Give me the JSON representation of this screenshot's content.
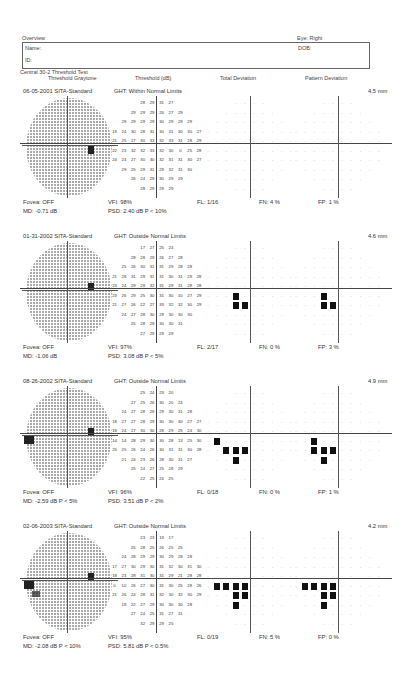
{
  "header": {
    "title": "Overview",
    "eye": "Eye: Right",
    "name_label": "Name:",
    "dob_label": "DOB:",
    "id_label": "ID:",
    "test_name": "Central 30-2 Threshold Test",
    "columns": [
      "Threshold Graytone",
      "Threshold (dB)",
      "Total Deviation",
      "Pattern Deviation"
    ]
  },
  "exams": [
    {
      "date": "06-05-2001",
      "strategy": "SITA-Standard",
      "ght": "GHT: Within Normal Limits",
      "pupil": "4.5 mm",
      "fovea": "Fovea: OFF",
      "md": "MD:  -0.71 dB",
      "vfi": "VFI:  98%",
      "psd": "PSD:  2.40 dB  P < 10%",
      "fl": "FL: 1/16",
      "fn": "FN:  4 %",
      "fp": "FP:  1 %",
      "thresholds": [
        [
          "28",
          "29",
          "31",
          "27"
        ],
        [
          "29",
          "29",
          "29",
          "26",
          "27",
          "29"
        ],
        [
          "28",
          "29",
          "29",
          "29",
          "30",
          "29",
          "29",
          "29"
        ],
        [
          "19",
          "24",
          "30",
          "28",
          "31",
          "30",
          "31",
          "30",
          "30",
          "27"
        ],
        [
          "21",
          "25",
          "27",
          "30",
          "33",
          "32",
          "33",
          "31",
          "28",
          "29"
        ],
        [
          "22",
          "23",
          "32",
          "32",
          "33",
          "32",
          "30",
          "0",
          "25",
          "28"
        ],
        [
          "24",
          "24",
          "27",
          "30",
          "30",
          "32",
          "31",
          "31",
          "30",
          "27"
        ],
        [
          "29",
          "25",
          "29",
          "31",
          "29",
          "32",
          "31",
          "30"
        ],
        [
          "26",
          "24",
          "29",
          "30",
          "29",
          "29"
        ],
        [
          "28",
          "29",
          "29",
          "29"
        ]
      ],
      "total_dev_dark": [],
      "pattern_dev_dark": []
    },
    {
      "date": "01-31-2002",
      "strategy": "SITA-Standard",
      "ght": "GHT: Outside Normal Limits",
      "pupil": "4.6 mm",
      "fovea": "Fovea: OFF",
      "md": "MD:  -1.06 dB",
      "vfi": "VFI:  97%",
      "psd": "PSD:  3.08 dB  P < 5%",
      "fl": "FL: 2/17",
      "fn": "FN:  0 %",
      "fp": "FP:  3 %",
      "thresholds": [
        [
          "17",
          "27",
          "25",
          "24"
        ],
        [
          "28",
          "28",
          "29",
          "26",
          "27",
          "28"
        ],
        [
          "25",
          "26",
          "30",
          "31",
          "31",
          "29",
          "28",
          "28"
        ],
        [
          "21",
          "28",
          "31",
          "29",
          "31",
          "31",
          "30",
          "31",
          "29",
          "28"
        ],
        [
          "23",
          "24",
          "29",
          "29",
          "32",
          "31",
          "29",
          "31",
          "28",
          "28"
        ],
        [
          "23",
          "26",
          "29",
          "25",
          "30",
          "31",
          "30",
          "10",
          "27",
          "29"
        ],
        [
          "21",
          "27",
          "26",
          "22",
          "27",
          "33",
          "32",
          "32",
          "30",
          "29"
        ],
        [
          "24",
          "27",
          "28",
          "30",
          "29",
          "30",
          "30",
          "30"
        ],
        [
          "25",
          "28",
          "29",
          "30",
          "30",
          "31"
        ],
        [
          "27",
          "29",
          "29",
          "29"
        ]
      ],
      "total_dev_dark": [
        [
          5,
          3
        ],
        [
          6,
          3
        ],
        [
          6,
          4
        ]
      ],
      "pattern_dev_dark": [
        [
          5,
          3
        ],
        [
          6,
          3
        ],
        [
          6,
          4
        ]
      ]
    },
    {
      "date": "08-26-2002",
      "strategy": "SITA-Standard",
      "ght": "GHT: Outside Normal Limits",
      "pupil": "4.9 mm",
      "fovea": "Fovea: OFF",
      "md": "MD:  -2.59 dB  P < 5%",
      "vfi": "VFI:  96%",
      "psd": "PSD:  3.51 dB  P < 2%",
      "fl": "FL: 0/18",
      "fn": "FN:  0 %",
      "fp": "FP:  1 %",
      "thresholds": [
        [
          "25",
          "24",
          "23",
          "20"
        ],
        [
          "27",
          "25",
          "26",
          "30",
          "20",
          "24"
        ],
        [
          "24",
          "27",
          "28",
          "29",
          "29",
          "30",
          "31",
          "28"
        ],
        [
          "18",
          "27",
          "27",
          "28",
          "29",
          "30",
          "30",
          "30",
          "27",
          "27"
        ],
        [
          "18",
          "24",
          "27",
          "30",
          "30",
          "28",
          "29",
          "25",
          "24",
          "30"
        ],
        [
          "14",
          "14",
          "28",
          "29",
          "30",
          "30",
          "28",
          "13",
          "25",
          "30"
        ],
        [
          "25",
          "25",
          "26",
          "24",
          "26",
          "30",
          "31",
          "31",
          "30",
          "28"
        ],
        [
          "21",
          "24",
          "23",
          "26",
          "28",
          "30",
          "31",
          "27"
        ],
        [
          "25",
          "24",
          "27",
          "25",
          "28",
          "29"
        ],
        [
          "22",
          "25",
          "24",
          "25"
        ]
      ],
      "total_dev_dark": [
        [
          5,
          1
        ],
        [
          6,
          2
        ],
        [
          6,
          3
        ],
        [
          6,
          4
        ],
        [
          7,
          3
        ]
      ],
      "pattern_dev_dark": [
        [
          5,
          2
        ],
        [
          6,
          2
        ],
        [
          6,
          3
        ],
        [
          6,
          4
        ],
        [
          7,
          3
        ]
      ]
    },
    {
      "date": "02-06-2003",
      "strategy": "SITA-Standard",
      "ght": "GHT: Outside Normal Limits",
      "pupil": "4.2 mm",
      "fovea": "Fovea: OFF",
      "md": "MD:  -2.08 dB  P < 10%",
      "vfi": "VFI:  95%",
      "psd": "PSD:  5.81 dB  P < 0.5%",
      "fl": "FL: 0/19",
      "fn": "FN:  5 %",
      "fp": "FP:  0 %",
      "thresholds": [
        [
          "23",
          "23",
          "19",
          "17"
        ],
        [
          "25",
          "28",
          "25",
          "26",
          "25",
          "25"
        ],
        [
          "24",
          "28",
          "29",
          "29",
          "30",
          "29",
          "28",
          "28"
        ],
        [
          "17",
          "27",
          "30",
          "29",
          "30",
          "31",
          "32",
          "30",
          "31",
          "30"
        ],
        [
          "18",
          "23",
          "28",
          "31",
          "30",
          "31",
          "29",
          "21",
          "28",
          "28"
        ],
        [
          "0",
          "10",
          "26",
          "27",
          "30",
          "31",
          "30",
          "25",
          "28",
          "26"
        ],
        [
          "21",
          "26",
          "24",
          "28",
          "31",
          "32",
          "30",
          "32",
          "30",
          "29"
        ],
        [
          "18",
          "22",
          "27",
          "29",
          "30",
          "30",
          "30",
          "28"
        ],
        [
          "27",
          "24",
          "25",
          "31",
          "27",
          "31"
        ],
        [
          "32",
          "29",
          "29",
          "25"
        ]
      ],
      "total_dev_dark": [
        [
          5,
          1
        ],
        [
          5,
          2
        ],
        [
          5,
          3
        ],
        [
          5,
          4
        ],
        [
          6,
          3
        ],
        [
          6,
          4
        ],
        [
          7,
          3
        ]
      ],
      "pattern_dev_dark": [
        [
          5,
          1
        ],
        [
          5,
          2
        ],
        [
          5,
          3
        ],
        [
          5,
          4
        ],
        [
          6,
          3
        ],
        [
          6,
          4
        ],
        [
          7,
          3
        ]
      ]
    }
  ]
}
